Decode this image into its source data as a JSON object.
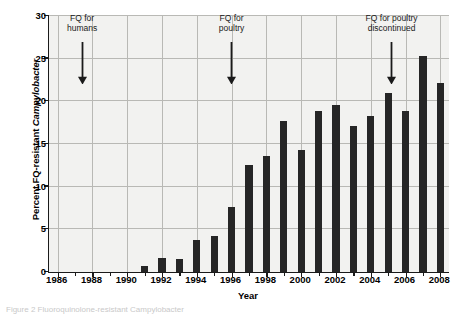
{
  "chart_data": {
    "type": "bar",
    "title": "",
    "xlabel": "Year",
    "ylabel": "Percent FQ-resistant Campylobacter",
    "ylabel_plain": "Percent FQ-resistant ",
    "ylabel_italic": "Campylobacter",
    "xlim": [
      1985.5,
      2008.5
    ],
    "ylim": [
      0,
      30
    ],
    "ytick_values": [
      0,
      5,
      10,
      15,
      20,
      25,
      30
    ],
    "ytick_labels": [
      "0",
      "5",
      "10",
      "15",
      "20",
      "25",
      "30"
    ],
    "xtick_values": [
      1986,
      1987,
      1988,
      1989,
      1990,
      1991,
      1992,
      1993,
      1994,
      1995,
      1996,
      1997,
      1998,
      1999,
      2000,
      2001,
      2002,
      2003,
      2004,
      2005,
      2006,
      2007,
      2008
    ],
    "xtick_labels_major": [
      "1986",
      "1988",
      "1990",
      "1992",
      "1994",
      "1996",
      "1998",
      "2000",
      "2002",
      "2004",
      "2006",
      "2008"
    ],
    "xtick_major_values": [
      1986,
      1988,
      1990,
      1992,
      1994,
      1996,
      1998,
      2000,
      2002,
      2004,
      2006,
      2008
    ],
    "grid": true,
    "grid_color": "#b9b9b5",
    "bar_color": "#262626",
    "plot_background": "#f2f2f0",
    "legend": null,
    "categories": [
      1986,
      1987,
      1988,
      1989,
      1990,
      1991,
      1992,
      1993,
      1994,
      1995,
      1996,
      1997,
      1998,
      1999,
      2000,
      2001,
      2002,
      2003,
      2004,
      2005,
      2006,
      2007,
      2008
    ],
    "values": [
      0,
      0,
      0,
      0,
      0,
      0.7,
      1.6,
      1.5,
      3.7,
      4.2,
      7.6,
      12.5,
      13.6,
      17.7,
      14.3,
      18.9,
      19.6,
      17.1,
      18.3,
      21.0,
      18.9,
      25.3,
      22.2
    ],
    "annotations": [
      {
        "text": "FQ for\nhumans",
        "x": 1987.4,
        "label_y": 28.0,
        "arrow_from_y": 27.0,
        "arrow_to_y": 22.0
      },
      {
        "text": "FQ for\npoultry",
        "x": 1996.0,
        "label_y": 28.0,
        "arrow_from_y": 27.0,
        "arrow_to_y": 22.0
      },
      {
        "text": "FQ for poultry\ndiscontinued",
        "x": 2005.2,
        "label_y": 28.0,
        "arrow_from_y": 27.0,
        "arrow_to_y": 22.0
      }
    ]
  },
  "caption": "Figure 2  Fluoroquinolone-resistant Campylobacter"
}
